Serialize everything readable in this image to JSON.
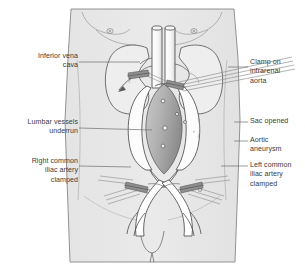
{
  "figure": {
    "colors": {
      "body_fill": "#e7e7e7",
      "body_outline": "#6b6b6b",
      "organ_outline": "#5a5a5a",
      "vessel_fill": "#ffffff",
      "vessel_outline": "#4d4d4d",
      "sac_interior_light": "#cfcfcf",
      "sac_interior_dark": "#8e8e8e",
      "clamp_stroke": "#7a7a7a",
      "clamp_jaw": "#8a8a8a",
      "leader_line": "#6e6e6e",
      "label_text": "#3c3c3c",
      "background": "#ffffff"
    }
  },
  "labels": {
    "left": [
      {
        "id": "inferior-vena-cava",
        "text": "Inferior vena\ncava",
        "x": 14,
        "y": 52,
        "width": 64,
        "leader": {
          "x1": 79,
          "y1": 62,
          "x2": 140,
          "y2": 62
        }
      },
      {
        "id": "lumbar-vessels-underrun",
        "text": "Lumbar vessels\nunderrun",
        "x": 6,
        "y": 118,
        "width": 72,
        "leader": {
          "x1": 79,
          "y1": 128,
          "x2": 152,
          "y2": 130
        }
      },
      {
        "id": "right-common-iliac-artery-clamped",
        "text": "Right common\niliac artery\nclamped",
        "x": 12,
        "y": 157,
        "width": 66,
        "leader": {
          "x1": 79,
          "y1": 166,
          "x2": 131,
          "y2": 167
        }
      }
    ],
    "right": [
      {
        "id": "clamp-on-infrareal-aorta",
        "text": "Clamp on\ninfrarenal\naorta",
        "x": 250,
        "y": 58,
        "width": 56,
        "leader": {
          "x1": 228,
          "y1": 67,
          "x2": 248,
          "y2": 67
        }
      },
      {
        "id": "sac-opened",
        "text": "Sac opened",
        "x": 250,
        "y": 117,
        "width": 56,
        "leader": {
          "x1": 234,
          "y1": 122,
          "x2": 248,
          "y2": 122
        }
      },
      {
        "id": "aortic-aneurysm",
        "text": "Aortic\naneurysm",
        "x": 250,
        "y": 136,
        "width": 56,
        "leader": {
          "x1": 234,
          "y1": 141,
          "x2": 248,
          "y2": 141
        }
      },
      {
        "id": "left-common-iliac-artery-clamped",
        "text": "Left common\niliac artery\nclamped",
        "x": 250,
        "y": 161,
        "width": 56,
        "leader": {
          "x1": 221,
          "y1": 166,
          "x2": 248,
          "y2": 166
        }
      }
    ]
  }
}
